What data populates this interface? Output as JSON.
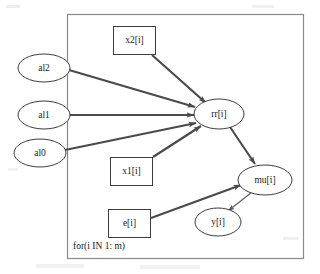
{
  "diagram": {
    "type": "directed-acyclic-graph",
    "title": "",
    "plate": {
      "label": "for(i IN 1: m)",
      "x": 67,
      "y": 14,
      "width": 236,
      "height": 244,
      "label_x": 73,
      "label_y": 247
    },
    "nodes": [
      {
        "id": "al2",
        "label": "al2",
        "shape": "ellipse",
        "cx": 44,
        "cy": 68,
        "rx": 26,
        "ry": 14
      },
      {
        "id": "al1",
        "label": "al1",
        "shape": "ellipse",
        "cx": 44,
        "cy": 115,
        "rx": 26,
        "ry": 14
      },
      {
        "id": "al0",
        "label": "al0",
        "shape": "ellipse",
        "cx": 40,
        "cy": 153,
        "rx": 26,
        "ry": 14
      },
      {
        "id": "x2i",
        "label": "x2[i]",
        "shape": "rectangle",
        "x": 113,
        "y": 26,
        "width": 43,
        "height": 29
      },
      {
        "id": "x1i",
        "label": "x1[i]",
        "shape": "rectangle",
        "x": 110,
        "y": 157,
        "width": 43,
        "height": 29
      },
      {
        "id": "ei",
        "label": "e[i]",
        "shape": "rectangle",
        "x": 108,
        "y": 209,
        "width": 43,
        "height": 29
      },
      {
        "id": "rri",
        "label": "rr[i]",
        "shape": "ellipse",
        "cx": 219,
        "cy": 114,
        "rx": 25,
        "ry": 15
      },
      {
        "id": "mui",
        "label": "mu[i]",
        "shape": "ellipse",
        "cx": 265,
        "cy": 180,
        "rx": 27,
        "ry": 15
      },
      {
        "id": "yi",
        "label": "y[i]",
        "shape": "ellipse",
        "cx": 218,
        "cy": 222,
        "rx": 23,
        "ry": 14
      }
    ],
    "edges": [
      {
        "from": "x2i",
        "to": "rri",
        "weight": "thick"
      },
      {
        "from": "al2",
        "to": "rri",
        "weight": "thick"
      },
      {
        "from": "al1",
        "to": "rri",
        "weight": "thick"
      },
      {
        "from": "al0",
        "to": "rri",
        "weight": "thick"
      },
      {
        "from": "x1i",
        "to": "rri",
        "weight": "thick"
      },
      {
        "from": "rri",
        "to": "mui",
        "weight": "thick"
      },
      {
        "from": "ei",
        "to": "mui",
        "weight": "thick"
      },
      {
        "from": "mui",
        "to": "yi",
        "weight": "thin"
      }
    ],
    "colors": {
      "node_stroke": "#3d3d3d",
      "node_fill": "#ffffff",
      "plate_stroke": "#8a8a8a",
      "edge_thick": "#4a4a4a",
      "edge_thin": "#5a5a5a",
      "text": "#1a1a1a",
      "background": "#ffffff"
    }
  }
}
